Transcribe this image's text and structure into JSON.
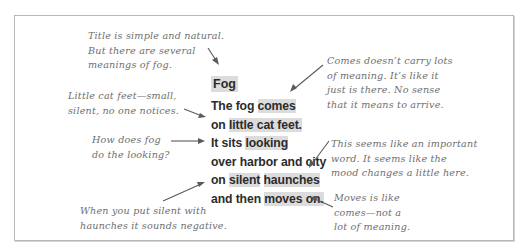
{
  "poem": {
    "title": "Fog",
    "lines": [
      [
        {
          "t": "The fog ",
          "hl": false
        },
        {
          "t": "comes",
          "hl": true
        }
      ],
      [
        {
          "t": "on ",
          "hl": false
        },
        {
          "t": "little cat feet.",
          "hl": true
        }
      ],
      [
        {
          "t": "It sits ",
          "hl": false
        },
        {
          "t": "looking",
          "hl": true
        }
      ],
      [
        {
          "t": "over harbor and city",
          "hl": false
        }
      ],
      [
        {
          "t": "on ",
          "hl": false
        },
        {
          "t": "silent",
          "hl": true
        },
        {
          "t": " ",
          "hl": false
        },
        {
          "t": "haunches",
          "hl": true
        }
      ],
      [
        {
          "t": "and then ",
          "hl": false
        },
        {
          "t": "moves on.",
          "hl": true
        }
      ]
    ]
  },
  "annotations": {
    "title_note": "Title is simple and natural.\nBut there are several\nmeanings of fog.",
    "little_cat_feet_note": "Little cat feet—small,\nsilent, no one notices.",
    "looking_note": "How does fog\ndo the looking?",
    "silent_haunches_note": "When you put silent with\nhaunches it sounds negative.",
    "comes_note": "Comes doesn’t carry lots\nof meaning. It’s like it\njust is there. No sense\nthat it means to arrive.",
    "haunches_note": "This seems like an important\nword. It seems like the\nmood changes a little here.",
    "moves_note": "Moves is like\ncomes—not a\nlot of meaning."
  }
}
